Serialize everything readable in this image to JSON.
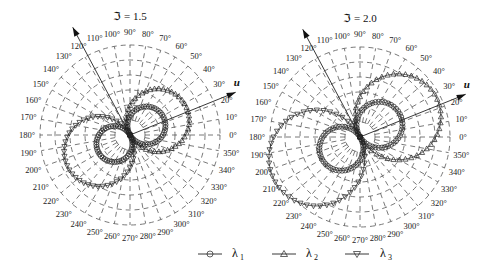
{
  "chart_data": [
    {
      "type": "polar",
      "title": "ℑ = 1.5",
      "center_px": [
        130,
        135
      ],
      "grid_radius_px": 90,
      "grid_rings": 6,
      "theta_ticks_deg": [
        0,
        10,
        20,
        30,
        40,
        50,
        60,
        70,
        80,
        90,
        100,
        110,
        120,
        130,
        140,
        150,
        160,
        170,
        180,
        190,
        200,
        210,
        220,
        230,
        240,
        250,
        260,
        270,
        280,
        290,
        300,
        310,
        320,
        330,
        340,
        350
      ],
      "theta_tick_labels": [
        "0°",
        "10°",
        "20°",
        "30°",
        "40°",
        "50°",
        "60°",
        "70°",
        "80°",
        "90°",
        "100°",
        "110°",
        "120°",
        "130°",
        "140°",
        "150°",
        "160°",
        "170°",
        "180°",
        "190°",
        "200°",
        "210°",
        "220°",
        "230°",
        "240°",
        "250°",
        "260°",
        "270°",
        "280°",
        "290°",
        "300°",
        "310°",
        "320°",
        "330°",
        "340°",
        "350°"
      ],
      "axes": [
        {
          "name": "u",
          "angle_deg": 22,
          "length_px": 114,
          "label": "u"
        },
        {
          "name": "v",
          "angle_deg": 118,
          "length_px": 122,
          "label": ""
        }
      ],
      "series": [
        {
          "name": "λ1",
          "marker": "circle",
          "lobes": [
            {
              "direction_deg": 30,
              "max_r_px": 38
            },
            {
              "direction_deg": 210,
              "max_r_px": 36
            }
          ]
        },
        {
          "name": "λ2",
          "marker": "triangle-up",
          "lobes": [
            {
              "direction_deg": 28,
              "max_r_px": 63
            }
          ]
        },
        {
          "name": "λ3",
          "marker": "triangle-down",
          "lobes": [
            {
              "direction_deg": 208,
              "max_r_px": 70
            }
          ]
        }
      ]
    },
    {
      "type": "polar",
      "title": "ℑ = 2.0",
      "center_px": [
        360,
        137
      ],
      "grid_radius_px": 90,
      "grid_rings": 6,
      "theta_ticks_deg": [
        0,
        10,
        20,
        30,
        40,
        50,
        60,
        70,
        80,
        90,
        100,
        110,
        120,
        130,
        140,
        150,
        160,
        170,
        180,
        190,
        200,
        210,
        220,
        230,
        240,
        250,
        260,
        270,
        280,
        290,
        300,
        310,
        320,
        330,
        340,
        350
      ],
      "theta_tick_labels": [
        "0°",
        "10°",
        "20°",
        "30°",
        "40°",
        "50°",
        "60°",
        "70°",
        "80°",
        "90°",
        "100°",
        "110°",
        "120°",
        "130°",
        "140°",
        "150°",
        "160°",
        "170°",
        "180°",
        "190°",
        "200°",
        "210°",
        "220°",
        "230°",
        "240°",
        "250°",
        "260°",
        "270°",
        "280°",
        "290°",
        "300°",
        "310°",
        "320°",
        "330°",
        "340°",
        "350°"
      ],
      "axes": [
        {
          "name": "u",
          "angle_deg": 22,
          "length_px": 114,
          "label": "u"
        },
        {
          "name": "v",
          "angle_deg": 118,
          "length_px": 122,
          "label": ""
        }
      ],
      "series": [
        {
          "name": "λ1",
          "marker": "circle",
          "lobes": [
            {
              "direction_deg": 32,
              "max_r_px": 46
            },
            {
              "direction_deg": 212,
              "max_r_px": 44
            }
          ]
        },
        {
          "name": "λ2",
          "marker": "triangle-up",
          "lobes": [
            {
              "direction_deg": 28,
              "max_r_px": 86
            }
          ]
        },
        {
          "name": "λ3",
          "marker": "triangle-down",
          "lobes": [
            {
              "direction_deg": 206,
              "max_r_px": 96
            }
          ]
        }
      ]
    }
  ],
  "legend": {
    "items": [
      {
        "label": "λ",
        "sub": "1",
        "marker": "circle"
      },
      {
        "label": "λ",
        "sub": "2",
        "marker": "triangle-up"
      },
      {
        "label": "λ",
        "sub": "3",
        "marker": "triangle-down"
      }
    ]
  }
}
